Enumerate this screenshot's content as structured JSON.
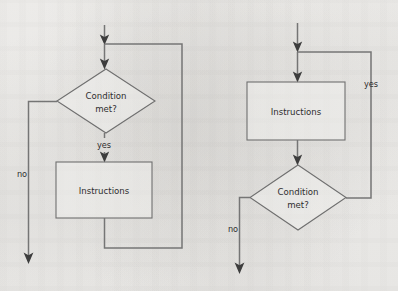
{
  "diagram": {
    "background_color": "#f3f2f0",
    "line_color": "#757575",
    "shape_stroke_color": "#6f6f6f",
    "arrow_color": "#3d3d3d",
    "text_color": "#2e2e2e",
    "charts": [
      {
        "id": "while-loop",
        "name": "pre-test-loop",
        "nodes": [
          {
            "id": "left-decision",
            "shape": "diamond",
            "label_line1": "Condition",
            "label_line2": "met?",
            "x": 57,
            "y": 69,
            "width": 98,
            "height": 64
          },
          {
            "id": "left-process",
            "shape": "rectangle",
            "label": "Instructions",
            "x": 56,
            "y": 162,
            "width": 96,
            "height": 56
          }
        ],
        "edges": [
          {
            "id": "left-entry",
            "label": "",
            "arrow": true
          },
          {
            "id": "left-merge-to-decision",
            "label": "",
            "arrow": true
          },
          {
            "id": "left-no-branch",
            "label": "no",
            "label_x": 22,
            "label_y": 174,
            "arrow": true
          },
          {
            "id": "left-yes-branch",
            "label": "yes",
            "label_x": 104,
            "label_y": 145,
            "arrow": true
          },
          {
            "id": "left-loopback",
            "label": "",
            "arrow": false
          }
        ]
      },
      {
        "id": "do-while-loop",
        "name": "post-test-loop",
        "nodes": [
          {
            "id": "right-process",
            "shape": "rectangle",
            "label": "Instructions",
            "x": 247,
            "y": 82,
            "width": 98,
            "height": 58
          },
          {
            "id": "right-decision",
            "shape": "diamond",
            "label_line1": "Condition",
            "label_line2": "met?",
            "x": 250,
            "y": 165,
            "width": 96,
            "height": 65
          }
        ],
        "edges": [
          {
            "id": "right-entry",
            "label": "",
            "arrow": true
          },
          {
            "id": "right-merge-to-process",
            "label": "",
            "arrow": true
          },
          {
            "id": "right-process-to-decision",
            "label": "",
            "arrow": true
          },
          {
            "id": "right-yes-branch",
            "label": "yes",
            "label_x": 371,
            "label_y": 84,
            "arrow": false
          },
          {
            "id": "right-no-branch",
            "label": "no",
            "label_x": 233,
            "label_y": 229,
            "arrow": true
          }
        ]
      }
    ]
  }
}
